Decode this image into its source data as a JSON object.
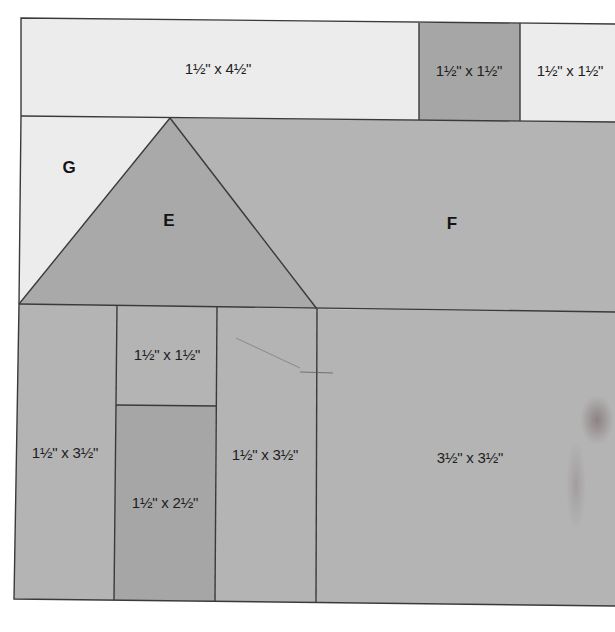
{
  "diagram": {
    "units": "inches",
    "colors": {
      "background_light": "#ececec",
      "fabric_medium": "#b4b4b4",
      "fabric_dark": "#a6a6a6",
      "outline": "#3a3a3a"
    },
    "pieces": {
      "top_left_strip": {
        "label": "1½\" x 4½\"",
        "shade": "light"
      },
      "chimney": {
        "label": "1½\" x 1½\"",
        "shade": "dark"
      },
      "top_right_square": {
        "label": "1½\" x 1½\"",
        "shade": "light"
      },
      "g": {
        "letter": "G",
        "shade": "light"
      },
      "e": {
        "letter": "E",
        "shade": "medium"
      },
      "f": {
        "letter": "F",
        "shade": "medium"
      },
      "left_wall": {
        "label": "1½\" x 3½\"",
        "shade": "medium"
      },
      "above_door": {
        "label": "1½\" x 1½\"",
        "shade": "medium"
      },
      "door": {
        "label": "1½\" x 2½\"",
        "shade": "dark"
      },
      "right_wall": {
        "label": "1½\" x 3½\"",
        "shade": "medium"
      },
      "side_house": {
        "label": "3½\" x 3½\"",
        "shade": "medium"
      }
    }
  }
}
